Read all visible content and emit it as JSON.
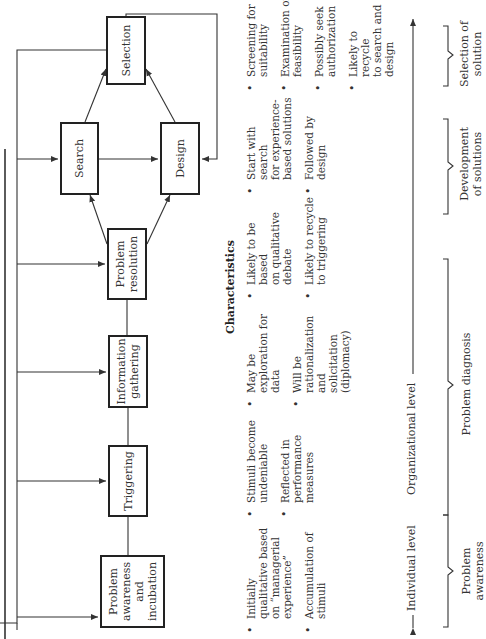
{
  "diagram": {
    "boxes": {
      "problem_awareness": "Problem\nawareness\nand\nincubation",
      "triggering": "Triggering",
      "information_gathering": "Information\ngathering",
      "problem_resolution": "Problem\nresolution",
      "search": "Search",
      "design": "Design",
      "selection": "Selection"
    },
    "characteristics_heading": "Characteristics",
    "characteristics": {
      "problem_awareness": [
        "Initially\nqualitative based\non “managerial\nexperience”",
        "Accumulation of\nstimuli"
      ],
      "triggering": [
        "Stimuli become\nundeniable",
        "Reflected in\nperformance\nmeasures"
      ],
      "information_gathering": [
        "May be\nexploration for\ndata",
        "Will be\nrationalization and\nsolicitation\n(diplomacy)"
      ],
      "problem_resolution": [
        "Likely to be based\non qualitative\ndebate",
        "Likely to recycle\nto triggering"
      ],
      "search_design": [
        "Start with search\nfor experience-\nbased solutions",
        "Followed by\ndesign"
      ],
      "selection": [
        "Screening for\nsuitability",
        "Examination of\nfeasibility",
        "Possibly seek\nauthorization",
        "Likely to recycle\nto search and\ndesign"
      ]
    },
    "levels": {
      "individual": "Individual level",
      "organizational": "Organizational level"
    },
    "phases": {
      "problem_awareness": "Problem awareness",
      "problem_diagnosis": "Problem diagnosis",
      "development": "Development\nof solutions",
      "selection": "Selection of\nsolution"
    },
    "colors": {
      "line": "#333333",
      "box_border": "#222222",
      "background": "#ffffff"
    }
  }
}
